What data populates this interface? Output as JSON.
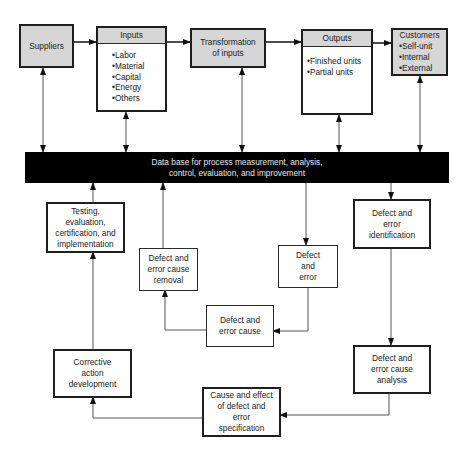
{
  "top_row": {
    "suppliers": {
      "label": "Suppliers"
    },
    "inputs": {
      "title": "Inputs",
      "items": [
        "Labor",
        "Material",
        "Capital",
        "Energy",
        "Others"
      ]
    },
    "transformation": {
      "line1": "Transformation",
      "line2": "of inputs"
    },
    "outputs": {
      "title": "Outputs",
      "items": [
        "Finished units",
        "Partial units"
      ]
    },
    "customers": {
      "title": "Customers",
      "items": [
        "Self-unit",
        "Internal",
        "External"
      ]
    }
  },
  "database": {
    "line1": "Data base for process measurement, analysis,",
    "line2": "control, evaluation, and improvement"
  },
  "cycle": {
    "testing": [
      "Testing,",
      "evaluation,",
      "certification, and",
      "implementation"
    ],
    "cause_removal": [
      "Defect and",
      "error cause",
      "removal"
    ],
    "defect_error": [
      "Defect",
      "and",
      "error"
    ],
    "identification": [
      "Defect and",
      "error",
      "identification"
    ],
    "error_cause": [
      "Defect and",
      "error cause"
    ],
    "corrective": [
      "Corrective",
      "action",
      "development"
    ],
    "cause_analysis": [
      "Defect and",
      "error cause",
      "analysis"
    ],
    "cause_effect": [
      "Cause and effect",
      "of defect and",
      "error",
      "specification"
    ]
  },
  "colors": {
    "box_fill_gray": "#d6d6d6",
    "database_fill": "#000000",
    "line": "#555555"
  }
}
